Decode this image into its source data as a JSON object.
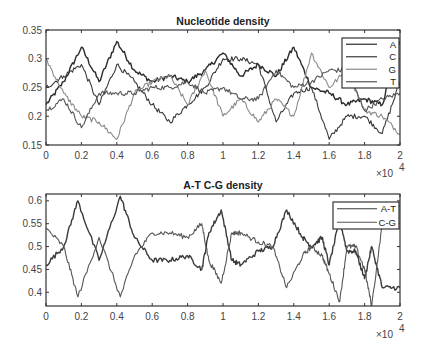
{
  "chart_data": [
    {
      "type": "line",
      "title": "Nucleotide density",
      "xlabel": "",
      "ylabel": "",
      "x_multiplier": "×10^4",
      "xlim": [
        0,
        2
      ],
      "ylim": [
        0.15,
        0.35
      ],
      "xticks": [
        "0",
        "0.2",
        "0.4",
        "0.6",
        "0.8",
        "1",
        "1.2",
        "1.4",
        "1.6",
        "1.8",
        "2"
      ],
      "yticks": [
        "0.15",
        "0.2",
        "0.25",
        "0.3",
        "0.35"
      ],
      "grid": false,
      "legend_position": "northeast",
      "x": [
        0,
        0.1,
        0.2,
        0.3,
        0.4,
        0.5,
        0.6,
        0.7,
        0.8,
        0.9,
        1.0,
        1.1,
        1.2,
        1.3,
        1.4,
        1.5,
        1.6,
        1.7,
        1.8,
        1.9,
        2.0
      ],
      "series": [
        {
          "name": "A",
          "color": "#2a2a2a",
          "values": [
            0.22,
            0.26,
            0.32,
            0.26,
            0.33,
            0.28,
            0.26,
            0.27,
            0.26,
            0.28,
            0.31,
            0.27,
            0.29,
            0.27,
            0.32,
            0.25,
            0.24,
            0.22,
            0.23,
            0.22,
            0.33
          ]
        },
        {
          "name": "C",
          "color": "#3a3a3a",
          "values": [
            0.25,
            0.27,
            0.29,
            0.22,
            0.29,
            0.26,
            0.22,
            0.19,
            0.22,
            0.25,
            0.3,
            0.3,
            0.29,
            0.19,
            0.24,
            0.25,
            0.16,
            0.2,
            0.2,
            0.17,
            0.26
          ]
        },
        {
          "name": "G",
          "color": "#8a8a8a",
          "values": [
            0.3,
            0.24,
            0.2,
            0.19,
            0.16,
            0.24,
            0.26,
            0.27,
            0.22,
            0.28,
            0.2,
            0.23,
            0.19,
            0.23,
            0.2,
            0.31,
            0.25,
            0.28,
            0.21,
            0.2,
            0.17
          ]
        },
        {
          "name": "T",
          "color": "#555555",
          "values": [
            0.21,
            0.23,
            0.18,
            0.24,
            0.24,
            0.24,
            0.25,
            0.25,
            0.26,
            0.24,
            0.25,
            0.23,
            0.23,
            0.28,
            0.25,
            0.26,
            0.28,
            0.28,
            0.21,
            0.23,
            0.24
          ]
        }
      ]
    },
    {
      "type": "line",
      "title": "A-T C-G density",
      "xlabel": "",
      "ylabel": "",
      "x_multiplier": "×10^4",
      "xlim": [
        0,
        2
      ],
      "ylim": [
        0.37,
        0.615
      ],
      "xticks": [
        "0",
        "0.2",
        "0.4",
        "0.6",
        "0.8",
        "1",
        "1.2",
        "1.4",
        "1.6",
        "1.8",
        "2"
      ],
      "yticks": [
        "0.4",
        "0.45",
        "0.5",
        "0.55",
        "0.6"
      ],
      "grid": false,
      "legend_position": "northeast",
      "x": [
        0,
        0.1,
        0.18,
        0.3,
        0.42,
        0.5,
        0.6,
        0.7,
        0.8,
        0.88,
        0.92,
        0.99,
        1.05,
        1.1,
        1.2,
        1.28,
        1.36,
        1.45,
        1.5,
        1.56,
        1.6,
        1.66,
        1.7,
        1.75,
        1.8,
        1.84,
        1.9,
        2.0
      ],
      "series": [
        {
          "name": "A-T",
          "color": "#3a3a3a",
          "values": [
            0.46,
            0.5,
            0.6,
            0.47,
            0.61,
            0.52,
            0.47,
            0.47,
            0.48,
            0.45,
            0.53,
            0.58,
            0.47,
            0.46,
            0.49,
            0.5,
            0.58,
            0.52,
            0.5,
            0.52,
            0.46,
            0.56,
            0.49,
            0.49,
            0.43,
            0.5,
            0.41,
            0.41
          ]
        },
        {
          "name": "C-G",
          "color": "#555555",
          "values": [
            0.54,
            0.5,
            0.39,
            0.52,
            0.39,
            0.48,
            0.53,
            0.53,
            0.52,
            0.55,
            0.47,
            0.42,
            0.53,
            0.53,
            0.51,
            0.5,
            0.41,
            0.48,
            0.5,
            0.48,
            0.44,
            0.38,
            0.5,
            0.5,
            0.45,
            0.37,
            0.55,
            0.59
          ]
        }
      ]
    }
  ],
  "figure": {
    "panels": [
      {
        "title": "Nucleotide density",
        "x_exponent_label": "×10",
        "x_exponent": "4"
      },
      {
        "title": "A-T C-G density",
        "x_exponent_label": "×10",
        "x_exponent": "4"
      }
    ]
  }
}
